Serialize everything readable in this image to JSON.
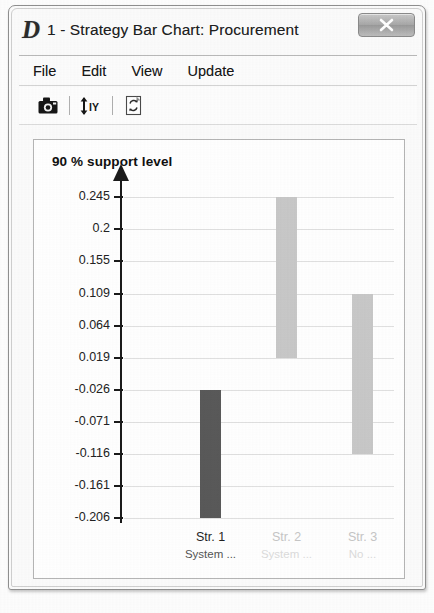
{
  "window": {
    "logo_letter": "D",
    "title": "1 - Strategy Bar Chart: Procurement",
    "close_label": "Close"
  },
  "menu": {
    "items": [
      {
        "label": "File"
      },
      {
        "label": "Edit"
      },
      {
        "label": "View"
      },
      {
        "label": "Update"
      }
    ]
  },
  "toolbar": {
    "buttons": [
      {
        "name": "camera-icon",
        "tooltip": "Camera"
      },
      {
        "name": "arrow-iy-icon",
        "tooltip": "IY"
      },
      {
        "name": "document-refresh-icon",
        "tooltip": "Refresh"
      }
    ]
  },
  "chart_data": {
    "type": "bar",
    "title": "90 % support level",
    "xlabel": "",
    "ylabel": "",
    "ylim": [
      -0.228,
      0.268
    ],
    "grid": true,
    "legend": null,
    "orientation": "vertical",
    "bar_style": "floating-range",
    "ytick_labels": [
      "0.245",
      "0.2",
      "0.155",
      "0.109",
      "0.064",
      "0.019",
      "-0.026",
      "-0.071",
      "-0.116",
      "-0.161",
      "-0.206"
    ],
    "ytick_values": [
      0.245,
      0.2,
      0.155,
      0.109,
      0.064,
      0.019,
      -0.026,
      -0.071,
      -0.116,
      -0.161,
      -0.206
    ],
    "categories": [
      "Str. 1",
      "Str. 2",
      "Str. 3"
    ],
    "category_sublabels": [
      "System ...",
      "System ...",
      "No ..."
    ],
    "series": [
      {
        "name": "range",
        "low": [
          -0.206,
          0.019,
          -0.116
        ],
        "high": [
          -0.026,
          0.245,
          0.109
        ],
        "colors": [
          "#595959",
          "#c8c8c8",
          "#c8c8c8"
        ]
      }
    ],
    "values": [
      0.18,
      0.226,
      0.225
    ],
    "colors": {
      "bar_dark": "#595959",
      "bar_light": "#c8c8c8",
      "axis": "#1a1a1a",
      "grid": "#e0e0e0",
      "label_active": "#1f1f1f",
      "label_faded": "#c6c6c6",
      "sublabel_faded": "#dcdcdc"
    }
  }
}
